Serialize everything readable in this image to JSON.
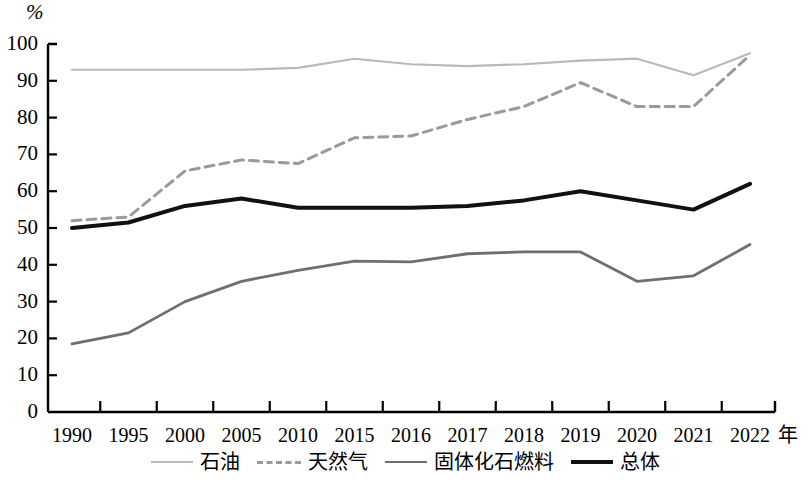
{
  "chart_data": {
    "type": "line",
    "title": "",
    "xlabel": "年",
    "ylabel": "%",
    "categories": [
      "1990",
      "1995",
      "2000",
      "2005",
      "2010",
      "2015",
      "2016",
      "2017",
      "2018",
      "2019",
      "2020",
      "2021",
      "2022"
    ],
    "ylim": [
      0,
      100
    ],
    "ytick_labels": [
      "0",
      "10",
      "20",
      "30",
      "40",
      "50",
      "60",
      "70",
      "80",
      "90",
      "100"
    ],
    "ytick_values": [
      0,
      10,
      20,
      30,
      40,
      50,
      60,
      70,
      80,
      90,
      100
    ],
    "grid": false,
    "legend_position": "bottom",
    "series": [
      {
        "name": "石油",
        "color": "#b9b9b9",
        "style": "solid",
        "width": 2.2,
        "values": [
          93,
          93,
          93,
          93,
          93.5,
          96,
          94.5,
          94,
          94.5,
          95.5,
          96,
          91.5,
          97.5
        ]
      },
      {
        "name": "天然气",
        "color": "#9a9a9a",
        "style": "dashed",
        "width": 3,
        "values": [
          52,
          53,
          65.5,
          68.5,
          67.5,
          74.5,
          75,
          79.5,
          83,
          89.5,
          83,
          83,
          97
        ]
      },
      {
        "name": "固体化石燃料",
        "color": "#6f6f6f",
        "style": "solid",
        "width": 2.8,
        "values": [
          18.5,
          21.5,
          30,
          35.5,
          38.5,
          41,
          40.8,
          43,
          43.5,
          43.5,
          35.5,
          37,
          45.5
        ]
      },
      {
        "name": "总体",
        "color": "#111111",
        "style": "solid",
        "width": 4,
        "values": [
          50,
          51.5,
          56,
          58,
          55.5,
          55.5,
          55.5,
          56,
          57.5,
          60,
          57.5,
          55,
          62
        ]
      }
    ]
  },
  "axes": {
    "unit_y": "%",
    "unit_x": "年"
  }
}
